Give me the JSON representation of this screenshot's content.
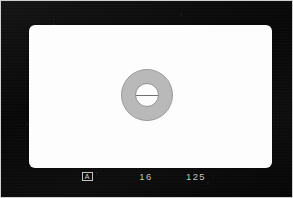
{
  "screen": {
    "title": "camera-viewfinder-focusing-screen",
    "field_color": "#fdfdfd",
    "mask_color": "#0a0a0a",
    "readout_color": "#c4c4c4"
  },
  "rangefinder": {
    "collar_label": "microprism-collar",
    "collar_color": "#b9b9b9",
    "split_circle_color": "#fcfcfc",
    "split_line_color": "#6e6e6e"
  },
  "readout": {
    "mode": "A",
    "aperture": "16",
    "shutter": "125"
  }
}
